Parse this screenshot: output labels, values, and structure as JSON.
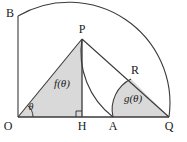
{
  "figure": {
    "colors": {
      "stroke": "#3a3a3a",
      "fill": "#d9d9d9",
      "background": "#ffffff",
      "text": "#1a1a1a"
    },
    "vertices": [
      {
        "id": "O",
        "label": "O",
        "x": 18,
        "y": 117
      },
      {
        "id": "B",
        "label": "B",
        "x": 18,
        "y": 16
      },
      {
        "id": "P",
        "label": "P",
        "x": 82,
        "y": 39
      },
      {
        "id": "H",
        "label": "H",
        "x": 82,
        "y": 117
      },
      {
        "id": "A",
        "label": "A",
        "x": 113,
        "y": 117
      },
      {
        "id": "Q",
        "label": "Q",
        "x": 169,
        "y": 117
      },
      {
        "id": "R",
        "label": "R",
        "x": 131,
        "y": 79
      }
    ],
    "labels": {
      "O": "O",
      "B": "B",
      "P": "P",
      "H": "H",
      "A": "A",
      "Q": "Q",
      "R": "R",
      "f_region": "f(θ)",
      "g_region": "g(θ)",
      "angle_theta": "θ"
    },
    "regions": [
      {
        "id": "f",
        "label": "f(θ)",
        "label_x": 62,
        "label_y": 86,
        "description": "triangle O-P-H"
      },
      {
        "id": "g",
        "label": "g(θ)",
        "label_x": 133,
        "label_y": 101,
        "description": "region A-R-Q bounded by arc AR and segments RQ, QA"
      }
    ],
    "angle": {
      "label": "θ",
      "x": 31,
      "y": 108,
      "at_vertex": "O"
    },
    "right_angle": {
      "at_vertex": "H",
      "x": 76,
      "y": 111,
      "size": 6
    }
  }
}
